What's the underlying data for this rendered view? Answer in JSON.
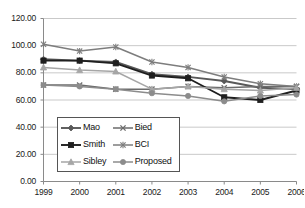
{
  "chart_data": {
    "type": "line",
    "title": "",
    "xlabel": "",
    "ylabel": "",
    "x": [
      "1999",
      "2000",
      "2001",
      "2002",
      "2003",
      "2004",
      "2005",
      "2006"
    ],
    "categories": [
      "1999",
      "2000",
      "2001",
      "2002",
      "2003",
      "2004",
      "2005",
      "2006"
    ],
    "ylim": [
      0,
      120
    ],
    "ytick_labels": [
      "0.00",
      "20.00",
      "40.00",
      "60.00",
      "80.00",
      "100.00",
      "120.00"
    ],
    "yticks": [
      0,
      20,
      40,
      60,
      80,
      100,
      120
    ],
    "grid": "horizontal",
    "legend_position": "inside-lower-left",
    "series": [
      {
        "name": "Mao",
        "marker": "diamond",
        "color": "#595959",
        "values": [
          90,
          89,
          88,
          79,
          77,
          74,
          69,
          68
        ]
      },
      {
        "name": "Bied",
        "marker": "x",
        "color": "#6b6b6b",
        "values": [
          71,
          71,
          68,
          68,
          70,
          69,
          70,
          70
        ]
      },
      {
        "name": "Smith",
        "marker": "square",
        "color": "#1f1f1f",
        "values": [
          89,
          89,
          87,
          78,
          76,
          62,
          60,
          67
        ]
      },
      {
        "name": "BCI",
        "marker": "asterisk",
        "color": "#7d7d7d",
        "values": [
          101,
          96,
          99,
          88,
          84,
          77,
          72,
          70
        ]
      },
      {
        "name": "Sibley",
        "marker": "triangle",
        "color": "#a6a6a6",
        "values": [
          84,
          82,
          81,
          68,
          70,
          68,
          67,
          69
        ]
      },
      {
        "name": "Proposed",
        "marker": "circle",
        "color": "#8c8c8c",
        "values": [
          71,
          70,
          68,
          65,
          63,
          59,
          63,
          64
        ]
      }
    ],
    "legend_order": [
      "Mao",
      "Bied",
      "Smith",
      "BCI",
      "Sibley",
      "Proposed"
    ]
  }
}
